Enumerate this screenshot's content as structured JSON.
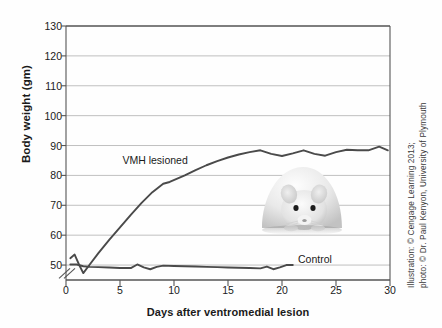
{
  "figure": {
    "background_color": "#fefefe",
    "axis_color": "#555555",
    "grid_color": "#b9b9b9",
    "line_color": "#4a4a4a"
  },
  "chart_data": {
    "type": "line",
    "title": "",
    "xlabel": "Days after ventromedial lesion",
    "ylabel": "Body weight (gm)",
    "xlim": [
      0,
      30
    ],
    "ylim": [
      45,
      130
    ],
    "yticks": [
      50,
      60,
      70,
      80,
      90,
      100,
      110,
      120,
      130
    ],
    "xticks": [
      0,
      5,
      10,
      15,
      20,
      25,
      30
    ],
    "grid": "horizontal",
    "y_axis_break": true,
    "y_axis_break_label": "axis-break-slashes",
    "legend": "inline-labels",
    "series": [
      {
        "name": "VMH lesioned",
        "label_x": 8.0,
        "label_y": 84.5,
        "x": [
          0.4,
          0.8,
          1.2,
          1.6,
          2.2,
          3.0,
          4.0,
          5.0,
          6.0,
          7.0,
          8.0,
          9.0,
          9.6,
          11.0,
          12.0,
          13.0,
          14.0,
          15.0,
          16.0,
          17.0,
          18.0,
          19.0,
          20.0,
          21.0,
          22.0,
          23.0,
          24.0,
          25.0,
          26.0,
          27.0,
          28.0,
          29.0,
          29.8
        ],
        "y": [
          52.3,
          53.5,
          50.2,
          47.3,
          50.2,
          54.0,
          58.4,
          62.6,
          66.8,
          70.8,
          74.4,
          77.2,
          77.8,
          80.0,
          81.8,
          83.4,
          84.8,
          86.0,
          87.0,
          87.8,
          88.4,
          87.2,
          86.5,
          87.4,
          88.4,
          87.2,
          86.6,
          87.8,
          88.6,
          88.4,
          88.4,
          89.6,
          88.4
        ]
      },
      {
        "name": "Control",
        "label_x": 21.3,
        "label_y": 51.5,
        "x": [
          0.4,
          1.0,
          1.6,
          2.2,
          3.0,
          4.0,
          5.0,
          6.0,
          6.6,
          7.2,
          7.8,
          8.4,
          9.0,
          10.0,
          11.0,
          12.0,
          13.0,
          14.0,
          15.0,
          16.0,
          17.0,
          18.0,
          18.6,
          19.2,
          19.8,
          20.4,
          21.0
        ],
        "y": [
          50.2,
          50.2,
          49.6,
          49.4,
          49.3,
          49.2,
          49.0,
          49.0,
          50.2,
          49.2,
          48.6,
          49.4,
          49.8,
          49.7,
          49.6,
          49.5,
          49.4,
          49.3,
          49.2,
          49.1,
          49.0,
          48.9,
          49.5,
          48.6,
          49.2,
          50.0,
          50.0
        ]
      }
    ]
  },
  "credit": {
    "line1": "Illustration: © Cengage Learning 2013;",
    "line2": "photo: © Dr. Paul Kenyon, University of Plymouth"
  },
  "photo": {
    "alt": "laboratory-rat-photograph"
  }
}
